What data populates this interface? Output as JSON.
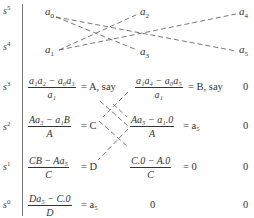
{
  "row_labels": [
    "s^5",
    "s^4",
    "s^3",
    "s^2",
    "s^1",
    "s^0"
  ],
  "row_label_display": [
    {
      "base": "s",
      "exp": "5"
    },
    {
      "base": "s",
      "exp": "4"
    },
    {
      "base": "s",
      "exp": "3"
    },
    {
      "base": "s",
      "exp": "2"
    },
    {
      "base": "s",
      "exp": "1"
    },
    {
      "base": "s",
      "exp": "0"
    }
  ],
  "row_s5": [
    {
      "base": "a",
      "sub": "0"
    },
    {
      "base": "a",
      "sub": "2"
    },
    {
      "base": "a",
      "sub": "4"
    }
  ],
  "row_s4": [
    {
      "base": "a",
      "sub": "1"
    },
    {
      "base": "a",
      "sub": "3"
    },
    {
      "base": "a",
      "sub": "5"
    }
  ],
  "row_s3": {
    "c1": {
      "num": "a₁a₂ − a₀a₃",
      "den": "a₁",
      "tail": "= A, say"
    },
    "c2": {
      "num": "a₁a₄ − a₀a₅",
      "den": "a₁",
      "tail": "= B, say"
    },
    "c3": "0"
  },
  "row_s2": {
    "c1": {
      "num": "Aa₃ − a₁B",
      "den": "A",
      "tail": "= C"
    },
    "c2": {
      "num": "Aa₅ − a₁.0",
      "den": "A",
      "tail": "= a₅"
    },
    "c3": "0"
  },
  "row_s1": {
    "c1": {
      "num": "CB − Aa₅",
      "den": "C",
      "tail": "= D"
    },
    "c2": {
      "num": "C.0 − A.0",
      "den": "C",
      "tail": "= 0"
    },
    "c3": "0"
  },
  "row_s0": {
    "c1": {
      "num": "Da₅ − C.0",
      "den": "D",
      "tail": "= a₅"
    },
    "c2": "0",
    "c3": "0"
  },
  "colors": {
    "text": "#333333",
    "rule": "#777777",
    "dash": "#555555"
  }
}
